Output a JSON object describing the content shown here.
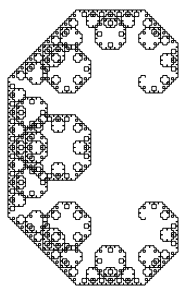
{
  "figure": {
    "type": "fractal-curve",
    "name": "Levy C curve",
    "iterations": 12,
    "stroke_color": "#000000",
    "background_color": "#ffffff",
    "bounds": {
      "x_min": 8,
      "x_max": 178,
      "y_min": 10,
      "y_max": 285
    }
  }
}
